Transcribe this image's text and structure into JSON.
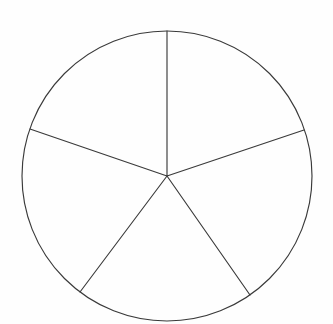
{
  "figure": {
    "background_color": "#fefefe",
    "stroke_color": "#3a3a3a",
    "stroke_width": 1.15,
    "canvas": {
      "width": 333,
      "height": 324
    }
  },
  "chart_data": {
    "type": "pie",
    "title": "",
    "subtitle": "",
    "xlabel": "",
    "ylabel": "",
    "legend": [],
    "legend_position": "none",
    "grid": false,
    "labels_shown": false,
    "values_shown": false,
    "center": {
      "x": 167,
      "y": 176
    },
    "radius": 145,
    "slice_count": 5,
    "start_angle_deg": -90,
    "categories": [
      "Sector 1",
      "Sector 2",
      "Sector 3",
      "Sector 4",
      "Sector 5"
    ],
    "values": [
      20,
      20,
      20,
      20,
      20
    ],
    "slice_angles_deg": [
      71.4,
      73.6,
      71.9,
      72.1,
      71.0
    ],
    "slice_fill_colors": [
      "none",
      "none",
      "none",
      "none",
      "none"
    ],
    "boundary_angles_deg": [
      -90,
      -18.6,
      55.0,
      126.9,
      161.0
    ],
    "boundaries": [
      {
        "name": "radius-top",
        "angle_deg": -90,
        "x1": 167,
        "y1": 176,
        "x2": 167,
        "y2": 31
      },
      {
        "name": "radius-upper-right",
        "angle_deg": -18.6,
        "x1": 167,
        "y1": 176,
        "x2": 304,
        "y2": 130
      },
      {
        "name": "radius-lower-right",
        "angle_deg": 55.0,
        "x1": 167,
        "y1": 176,
        "x2": 250,
        "y2": 295
      },
      {
        "name": "radius-lower-left",
        "angle_deg": 126.9,
        "x1": 167,
        "y1": 176,
        "x2": 80,
        "y2": 292
      },
      {
        "name": "radius-upper-left",
        "angle_deg": 161.0,
        "x1": 167,
        "y1": 176,
        "x2": 30,
        "y2": 129
      }
    ]
  }
}
